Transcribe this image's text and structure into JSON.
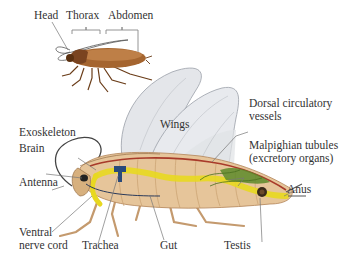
{
  "top_figure": {
    "labels": {
      "head": "Head",
      "thorax": "Thorax",
      "abdomen": "Abdomen"
    }
  },
  "main_figure": {
    "labels": {
      "wings": "Wings",
      "dorsal_line1": "Dorsal circulatory",
      "dorsal_line2": "vessels",
      "malpighian_line1": "Malpighian tubules",
      "malpighian_line2": "(excretory organs)",
      "anus": "Anus",
      "exoskeleton": "Exoskeleton",
      "brain": "Brain",
      "antenna": "Antenna",
      "ventral_line1": "Ventral",
      "ventral_line2": "nerve cord",
      "trachea": "Trachea",
      "gut": "Gut",
      "testis": "Testis"
    }
  },
  "colors": {
    "body_tan": "#e8c9a0",
    "body_shadow": "#c9a074",
    "roach_brown": "#9a5a2a",
    "gut_yellow": "#e8d820",
    "malpighian_green": "#5d8a2a",
    "vessel_red": "#a83a2a",
    "nerve_blue": "#2a4a7a",
    "wing_gray": "#e6e8ec",
    "leader_line": "#777777"
  }
}
